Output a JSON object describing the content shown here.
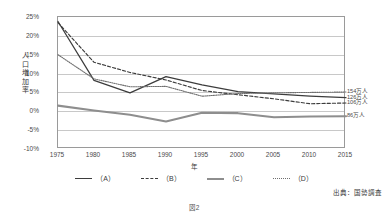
{
  "header": {
    "cropped_text": "",
    "figure_caption": "図2",
    "source_note": "出典：国勢調査"
  },
  "axes": {
    "y_title": "人口増加率",
    "x_title": "年",
    "y_ticks": [
      "25%",
      "20%",
      "15%",
      "10%",
      "5%",
      "0%",
      "-5%",
      "-10%"
    ],
    "x_ticks": [
      "1975",
      "1980",
      "1985",
      "1990",
      "1995",
      "2000",
      "2005",
      "2010",
      "2015"
    ]
  },
  "legend": {
    "items": [
      {
        "label": "（A）",
        "style": "solid-dark"
      },
      {
        "label": "（B）",
        "style": "dashed"
      },
      {
        "label": "（C）",
        "style": "solid-gray"
      },
      {
        "label": "（D）",
        "style": "dotted"
      }
    ]
  },
  "endpoint_labels": [
    {
      "text": "154万人",
      "series": "D"
    },
    {
      "text": "126万人",
      "series": "A"
    },
    {
      "text": "106万人",
      "series": "B"
    },
    {
      "text": "86万人",
      "series": "C"
    }
  ],
  "colors": {
    "series_a": "#3d3d3d",
    "series_b": "#3d3d3d",
    "series_c": "#8e8e8e",
    "series_d": "#6f6f6f",
    "grid": "#c8c8c8",
    "frame": "#9a9a9a",
    "text": "#3a3a3a"
  },
  "chart_data": {
    "type": "line",
    "title": "",
    "subtitle": "",
    "xlabel": "年",
    "ylabel": "人口増加率",
    "x": [
      1975,
      1980,
      1985,
      1990,
      1995,
      2000,
      2005,
      2010,
      2015
    ],
    "xlim": [
      1975,
      2015
    ],
    "ylim": [
      -10,
      25
    ],
    "y_tick_values": [
      25,
      20,
      15,
      10,
      5,
      0,
      -5,
      -10
    ],
    "y_unit": "%",
    "grid": "horizontal",
    "legend_position": "bottom",
    "annotations": [
      {
        "text": "154万人",
        "at_x": 2015,
        "series": "(D)"
      },
      {
        "text": "126万人",
        "at_x": 2015,
        "series": "(A)"
      },
      {
        "text": "106万人",
        "at_x": 2015,
        "series": "(B)"
      },
      {
        "text": "86万人",
        "at_x": 2015,
        "series": "(C)"
      }
    ],
    "series": [
      {
        "name": "（A）",
        "style": "solid-dark",
        "values": [
          23.8,
          8.2,
          4.9,
          9.2,
          7.0,
          5.2,
          4.6,
          4.0,
          3.6
        ]
      },
      {
        "name": "（B）",
        "style": "dashed",
        "values": [
          23.5,
          13.0,
          10.3,
          8.3,
          5.5,
          4.4,
          3.3,
          2.0,
          2.2
        ]
      },
      {
        "name": "（C）",
        "style": "solid-gray",
        "values": [
          1.5,
          0.2,
          -0.9,
          -2.7,
          -0.4,
          -0.5,
          -1.6,
          -1.4,
          -1.3
        ]
      },
      {
        "name": "（D）",
        "style": "dotted",
        "values": [
          15.0,
          8.6,
          6.5,
          6.6,
          4.0,
          4.7,
          4.9,
          5.0,
          5.1
        ]
      }
    ]
  }
}
